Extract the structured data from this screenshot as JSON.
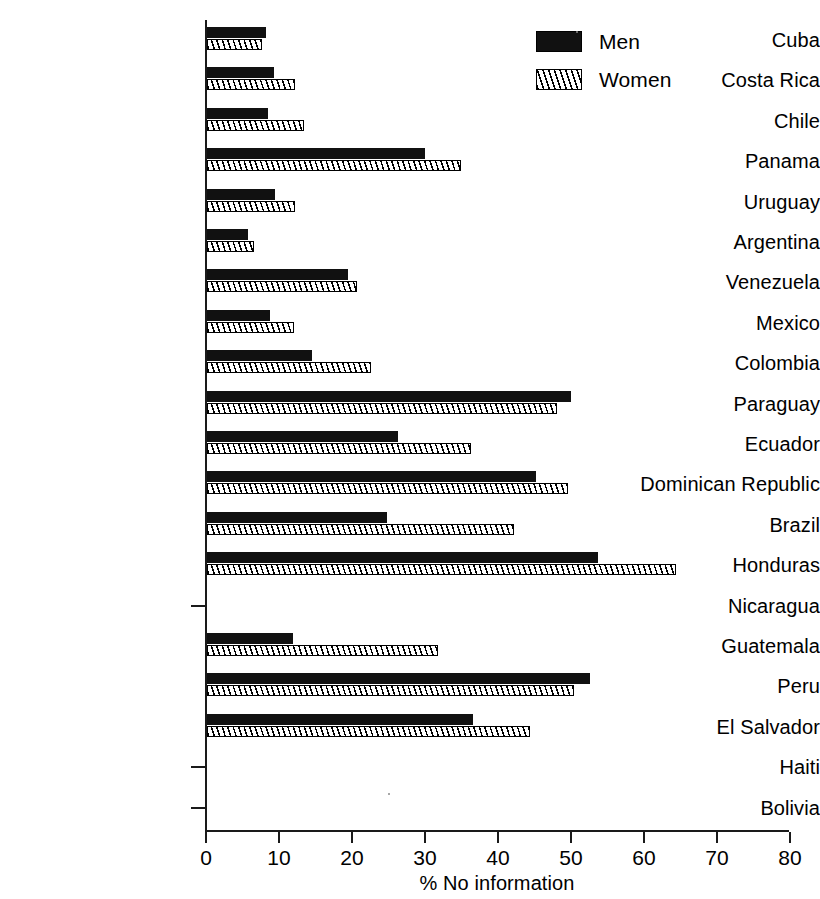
{
  "chart_data": {
    "type": "bar",
    "orientation": "horizontal",
    "title": "",
    "xlabel": "% No information",
    "ylabel": "",
    "xlim": [
      0,
      80
    ],
    "xticks": [
      0,
      10,
      20,
      30,
      40,
      50,
      60,
      70,
      80
    ],
    "grid": false,
    "legend_position": "top-right",
    "categories": [
      "Cuba",
      "Costa Rica",
      "Chile",
      "Panama",
      "Uruguay",
      "Argentina",
      "Venezuela",
      "Mexico",
      "Colombia",
      "Paraguay",
      "Ecuador",
      "Dominican Republic",
      "Brazil",
      "Honduras",
      "Nicaragua",
      "Guatemala",
      "Peru",
      "El Salvador",
      "Haiti",
      "Bolivia"
    ],
    "series": [
      {
        "name": "Men",
        "color": "#111111",
        "pattern": "solid",
        "values": [
          8.1,
          9.2,
          8.4,
          29.9,
          9.3,
          5.6,
          19.3,
          8.6,
          14.4,
          49.8,
          26.2,
          45.0,
          24.6,
          53.5,
          0,
          11.8,
          52.4,
          36.4,
          0,
          0
        ]
      },
      {
        "name": "Women",
        "color": "#ffffff",
        "pattern": "diagonal-hatch",
        "values": [
          7.5,
          12.0,
          13.3,
          34.8,
          12.0,
          6.4,
          20.6,
          11.9,
          22.4,
          47.9,
          36.2,
          49.4,
          42.1,
          64.2,
          0,
          31.7,
          50.3,
          44.2,
          0,
          0
        ]
      }
    ]
  },
  "legend": {
    "items": [
      {
        "label": "Men"
      },
      {
        "label": "Women"
      }
    ]
  },
  "axis": {
    "x_title": "% No information",
    "tick_labels": [
      "0",
      "10",
      "20",
      "30",
      "40",
      "50",
      "60",
      "70",
      "80"
    ]
  }
}
